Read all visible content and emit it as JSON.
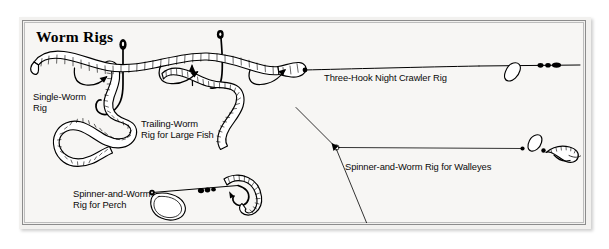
{
  "figure": {
    "title": "Worm Rigs",
    "background_color": "#f7f6f4",
    "ink_color": "#000000",
    "frame_color": "#8c8c8c",
    "frame_inner_color": "#bdbdbd"
  },
  "captions": {
    "single_worm": "Single-Worm\nRig",
    "trailing_worm": "Trailing-Worm\nRig for Large Fish",
    "spinner_perch": "Spinner-and-Worm\nRig for Perch",
    "three_hook": "Three-Hook Night Crawler Rig",
    "spinner_walleye": "Spinner-and-Worm Rig for Walleyes"
  },
  "rigs": [
    {
      "id": "single-worm-rig",
      "label": "Single-Worm Rig",
      "parts": [
        "hook",
        "hook-eye",
        "worm"
      ]
    },
    {
      "id": "trailing-worm-rig",
      "label": "Trailing-Worm Rig for Large Fish",
      "parts": [
        "hook",
        "hook-eye",
        "barb",
        "worm"
      ]
    },
    {
      "id": "spinner-and-worm-rig-for-perch",
      "label": "Spinner-and-Worm Rig for Perch",
      "parts": [
        "spinner-blade",
        "shaft",
        "beads",
        "hook",
        "worm"
      ]
    },
    {
      "id": "three-hook-night-crawler-rig",
      "label": "Three-Hook Night Crawler Rig",
      "parts": [
        "night-crawler",
        "hook-1",
        "hook-2",
        "hook-3",
        "leader",
        "spinner-blade",
        "beads"
      ]
    },
    {
      "id": "spinner-and-worm-rig-for-walleyes",
      "label": "Spinner-and-Worm Rig for Walleyes",
      "parts": [
        "main-line",
        "three-way-swivel",
        "dropper-line",
        "sinker",
        "leader",
        "beads",
        "spinner-blade",
        "worm"
      ]
    }
  ]
}
